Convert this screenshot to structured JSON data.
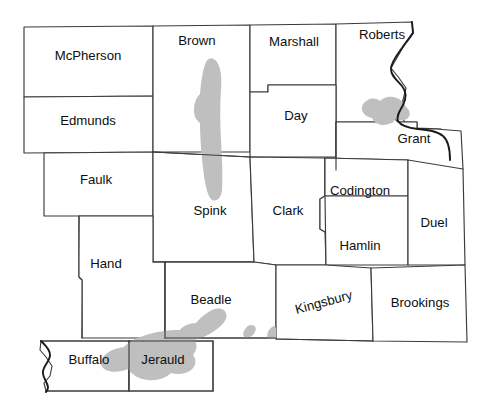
{
  "map": {
    "title": "Northeastern South Dakota county map",
    "background_color": "#ffffff",
    "county_fill": "#ffffff",
    "county_border_color": "#3b3b3b",
    "state_border_color": "#1a1a1a",
    "overlay_color": "#bfbfbf",
    "counties": [
      {
        "id": "mcpherson",
        "label": "McPherson",
        "label_x": 88,
        "label_y": 57,
        "rotation": 0
      },
      {
        "id": "brown",
        "label": "Brown",
        "label_x": 197,
        "label_y": 42,
        "rotation": 0
      },
      {
        "id": "marshall",
        "label": "Marshall",
        "label_x": 294,
        "label_y": 43,
        "rotation": 0
      },
      {
        "id": "roberts",
        "label": "Roberts",
        "label_x": 382,
        "label_y": 36,
        "rotation": 0
      },
      {
        "id": "edmunds",
        "label": "Edmunds",
        "label_x": 88,
        "label_y": 122,
        "rotation": 0
      },
      {
        "id": "day",
        "label": "Day",
        "label_x": 296,
        "label_y": 117,
        "rotation": 0
      },
      {
        "id": "grant",
        "label": "Grant",
        "label_x": 414,
        "label_y": 140,
        "rotation": 0
      },
      {
        "id": "faulk",
        "label": "Faulk",
        "label_x": 96,
        "label_y": 181,
        "rotation": 0
      },
      {
        "id": "spink",
        "label": "Spink",
        "label_x": 210,
        "label_y": 212,
        "rotation": 0
      },
      {
        "id": "clark",
        "label": "Clark",
        "label_x": 288,
        "label_y": 212,
        "rotation": 0
      },
      {
        "id": "codington",
        "label": "Codington",
        "label_x": 360,
        "label_y": 192,
        "rotation": 0
      },
      {
        "id": "duel",
        "label": "Duel",
        "label_x": 434,
        "label_y": 224,
        "rotation": 0
      },
      {
        "id": "hamlin",
        "label": "Hamlin",
        "label_x": 360,
        "label_y": 247,
        "rotation": 0
      },
      {
        "id": "hand",
        "label": "Hand",
        "label_x": 106,
        "label_y": 265,
        "rotation": 0
      },
      {
        "id": "beadle",
        "label": "Beadle",
        "label_x": 211,
        "label_y": 301,
        "rotation": 0
      },
      {
        "id": "kingsbury",
        "label": "Kingsbury",
        "label_x": 324,
        "label_y": 303,
        "rotation": -15
      },
      {
        "id": "brookings",
        "label": "Brookings",
        "label_x": 420,
        "label_y": 304,
        "rotation": 0
      },
      {
        "id": "buffalo",
        "label": "Buffalo",
        "label_x": 89,
        "label_y": 361,
        "rotation": 0
      },
      {
        "id": "jerauld",
        "label": "Jerauld",
        "label_x": 163,
        "label_y": 361,
        "rotation": 0
      }
    ],
    "overlay_regions": [
      {
        "id": "brown-spink-band",
        "name": "shaded-band-brown-spink"
      },
      {
        "id": "grant-patch",
        "name": "shaded-patch-grant"
      },
      {
        "id": "jerauld-patch",
        "name": "shaded-patch-jerauld-buffalo"
      },
      {
        "id": "beadle-speck",
        "name": "shaded-speck-beadle"
      }
    ]
  }
}
